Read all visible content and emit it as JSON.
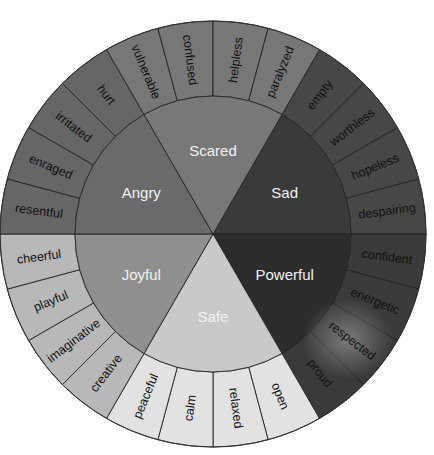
{
  "diagram": {
    "center": {
      "x": 213,
      "y": 234
    },
    "inner_radius": 138,
    "outer_radius": 213,
    "sectors": [
      {
        "name": "Sad",
        "start_deg": -60,
        "end_deg": 0,
        "inner_color": "#3a3a3a",
        "outer_color": "#474747",
        "words": [
          "empty",
          "worthless",
          "hopeless",
          "despairing"
        ]
      },
      {
        "name": "Powerful",
        "start_deg": 0,
        "end_deg": 60,
        "inner_color": "#2c2c2c",
        "outer_color": "#3a3a3a",
        "words": [
          "confident",
          "energetic",
          "respected",
          "proud"
        ]
      },
      {
        "name": "Safe",
        "start_deg": 60,
        "end_deg": 120,
        "inner_color": "#c9c9c9",
        "outer_color": "#e2e2e2",
        "words": [
          "open",
          "relaxed",
          "calm",
          "peaceful"
        ]
      },
      {
        "name": "Joyful",
        "start_deg": 120,
        "end_deg": 180,
        "inner_color": "#8f8f8f",
        "outer_color": "#b8b8b8",
        "words": [
          "creative",
          "imaginative",
          "playful",
          "cheerful"
        ]
      },
      {
        "name": "Angry",
        "start_deg": 180,
        "end_deg": 240,
        "inner_color": "#6a6a6a",
        "outer_color": "#666666",
        "words": [
          "resentful",
          "enraged",
          "irritated",
          "hurt"
        ]
      },
      {
        "name": "Scared",
        "start_deg": 240,
        "end_deg": 300,
        "inner_color": "#787878",
        "outer_color": "#777777",
        "words": [
          "vulnerable",
          "confused",
          "helpless",
          "paralyzed"
        ]
      }
    ]
  }
}
